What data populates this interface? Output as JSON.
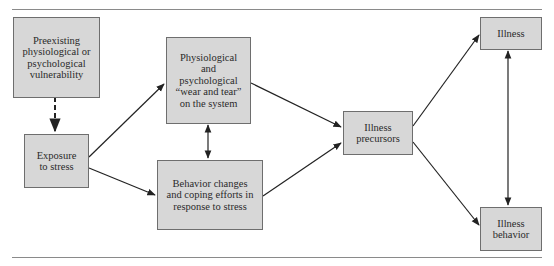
{
  "diagram": {
    "nodes": {
      "vulnerability": "Preexisting physiological or psychological vulnerability",
      "exposure": "Exposure to stress",
      "wear_tear": "Physiological and psychological “wear and tear” on the system",
      "behavior_changes": "Behavior changes and coping efforts in response to stress",
      "precursors": "Illness precursors",
      "illness": "Illness",
      "illness_behavior": "Illness behavior"
    },
    "edges": [
      {
        "from": "vulnerability",
        "to": "exposure",
        "style": "dashed"
      },
      {
        "from": "exposure",
        "to": "wear_tear",
        "style": "solid"
      },
      {
        "from": "exposure",
        "to": "behavior_changes",
        "style": "solid"
      },
      {
        "from": "wear_tear",
        "to": "behavior_changes",
        "style": "bidirectional"
      },
      {
        "from": "wear_tear",
        "to": "precursors",
        "style": "solid"
      },
      {
        "from": "behavior_changes",
        "to": "precursors",
        "style": "solid"
      },
      {
        "from": "precursors",
        "to": "illness",
        "style": "solid"
      },
      {
        "from": "precursors",
        "to": "illness_behavior",
        "style": "solid"
      },
      {
        "from": "illness",
        "to": "illness_behavior",
        "style": "bidirectional"
      }
    ]
  }
}
